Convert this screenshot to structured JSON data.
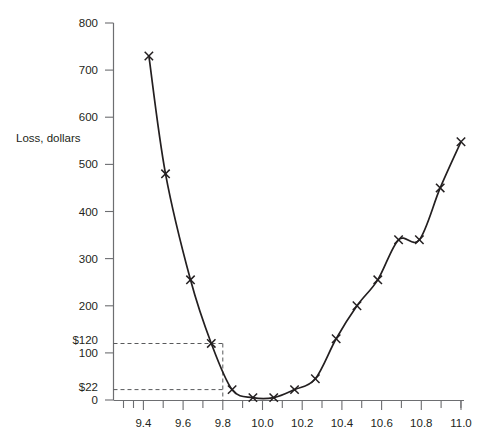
{
  "chart_data": {
    "type": "line",
    "title": "",
    "xlabel": "",
    "ylabel": "Loss, dollars",
    "xlim": [
      9.33,
      11.12
    ],
    "ylim": [
      0,
      830
    ],
    "grid": false,
    "legend": "none",
    "x_ticks_major": [
      "9.4",
      "9.6",
      "9.8",
      "10.0",
      "10.2",
      "10.4",
      "10.6",
      "10.8",
      "11.0"
    ],
    "x_tick_values": [
      9.4,
      9.6,
      9.8,
      10.0,
      10.2,
      10.4,
      10.6,
      10.8,
      11.0
    ],
    "x_minor_step": 0.1,
    "y_ticks": [
      "0",
      "100",
      "200",
      "300",
      "400",
      "500",
      "600",
      "700",
      "800"
    ],
    "y_tick_values": [
      0,
      100,
      200,
      300,
      400,
      500,
      600,
      700,
      800
    ],
    "marker": "x",
    "series_name": "Taguchi loss function",
    "x": [
      9.5,
      9.58,
      9.7,
      9.8,
      9.9,
      10.0,
      10.1,
      10.2,
      10.3,
      10.4,
      10.5,
      10.6,
      10.7,
      10.8,
      10.9,
      11.0
    ],
    "values": [
      730,
      480,
      255,
      120,
      22,
      5,
      5,
      22,
      45,
      130,
      200,
      255,
      340,
      340,
      450,
      548
    ],
    "annotations": [
      {
        "name": "loss-120",
        "label": "$120",
        "y_value": 120,
        "x_value": 9.8
      },
      {
        "name": "loss-22",
        "label": "$22",
        "y_value": 22,
        "x_value": 9.8
      }
    ]
  },
  "axes": {
    "y_axis_label": "Loss, dollars"
  }
}
